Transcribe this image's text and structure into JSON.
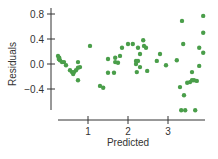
{
  "chart_data": {
    "type": "scatter",
    "title": "",
    "xlabel": "Predicted",
    "ylabel": "Residuals",
    "xlim": [
      0.25,
      3.95
    ],
    "ylim": [
      -0.75,
      0.95
    ],
    "x_ticks": [
      1,
      2,
      3
    ],
    "x_tick_labels": [
      "1",
      "2",
      "3"
    ],
    "y_ticks": [
      0.8,
      0.4,
      0.0,
      -0.4
    ],
    "y_tick_labels": [
      "0.8",
      "0.4",
      "0.0",
      "-0.4"
    ],
    "grid": false,
    "legend": null,
    "marker_color": "#4a9e4a",
    "series": [
      {
        "name": "residuals",
        "points": [
          [
            0.25,
            0.13
          ],
          [
            0.28,
            0.1
          ],
          [
            0.3,
            0.06
          ],
          [
            0.35,
            0.03
          ],
          [
            0.4,
            0.03
          ],
          [
            0.27,
            0.08
          ],
          [
            0.45,
            -0.02
          ],
          [
            0.55,
            -0.1
          ],
          [
            0.6,
            -0.13
          ],
          [
            0.65,
            -0.13
          ],
          [
            0.7,
            -0.1
          ],
          [
            0.75,
            -0.06
          ],
          [
            0.8,
            -0.05
          ],
          [
            0.63,
            -0.16
          ],
          [
            0.75,
            0.03
          ],
          [
            0.75,
            -0.26
          ],
          [
            1.05,
            0.29
          ],
          [
            1.3,
            -0.35
          ],
          [
            1.38,
            -0.38
          ],
          [
            1.5,
            0.08
          ],
          [
            1.68,
            0.1
          ],
          [
            1.68,
            0.03
          ],
          [
            1.75,
            0.02
          ],
          [
            1.8,
            0.13
          ],
          [
            1.85,
            0.26
          ],
          [
            2.0,
            0.32
          ],
          [
            2.12,
            0.32
          ],
          [
            2.25,
            0.26
          ],
          [
            2.3,
            0.16
          ],
          [
            2.38,
            0.38
          ],
          [
            2.4,
            0.29
          ],
          [
            2.45,
            0.26
          ],
          [
            1.5,
            -0.14
          ],
          [
            1.65,
            -0.14
          ],
          [
            2.2,
            0.05
          ],
          [
            2.2,
            0.0
          ],
          [
            2.25,
            0.05
          ],
          [
            2.3,
            -0.05
          ],
          [
            2.22,
            -0.13
          ],
          [
            2.48,
            -0.11
          ],
          [
            2.72,
            0.05
          ],
          [
            2.8,
            0.16
          ],
          [
            2.95,
            -0.02
          ],
          [
            3.22,
            0.06
          ],
          [
            3.35,
            0.69
          ],
          [
            3.38,
            0.32
          ],
          [
            3.3,
            -0.37
          ],
          [
            3.4,
            -0.5
          ],
          [
            3.33,
            -0.74
          ],
          [
            3.43,
            -0.74
          ],
          [
            3.68,
            -0.74
          ],
          [
            3.48,
            -0.3
          ],
          [
            3.55,
            -0.29
          ],
          [
            3.6,
            -0.26
          ],
          [
            3.65,
            -0.26
          ],
          [
            3.72,
            -0.27
          ],
          [
            3.6,
            -0.13
          ],
          [
            3.78,
            -0.03
          ],
          [
            3.78,
            0.26
          ],
          [
            3.88,
            0.18
          ],
          [
            3.88,
            0.5
          ],
          [
            3.88,
            0.77
          ]
        ]
      }
    ]
  }
}
